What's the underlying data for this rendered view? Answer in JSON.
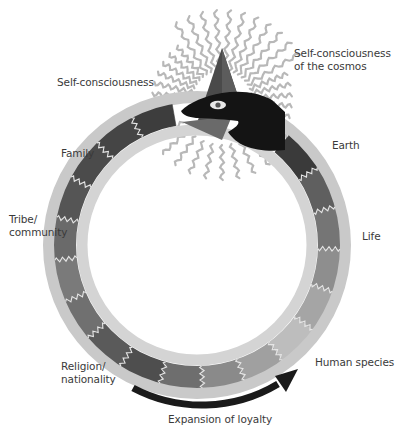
{
  "diagram": {
    "type": "ouroboros-cycle",
    "labels": {
      "self_consciousness": "Self-consciousness",
      "cosmos": "Self-consciousness\nof the cosmos",
      "family": "Family",
      "tribe": "Tribe/\ncommunity",
      "religion": "Religion/\nnationality",
      "human_species": "Human species",
      "life": "Life",
      "earth": "Earth",
      "expansion": "Expansion of loyalty"
    },
    "stages_in_order": [
      "Self-consciousness",
      "Family",
      "Tribe/community",
      "Religion/nationality",
      "Human species",
      "Life",
      "Earth",
      "Self-consciousness of the cosmos"
    ],
    "arrow_direction": "clockwise-left-to-right along bottom",
    "colors": {
      "outer_ring": "#c9c9c9",
      "inner_ring": "#d4d4d4",
      "snake_head": "#141414",
      "pyramid": "#4a4a4a",
      "rays": "#b8b8b8",
      "arrow": "#1a1a1a",
      "wave_lines": "#e6e6e6",
      "segments": [
        "#3d3d3d",
        "#454545",
        "#4b4b4b",
        "#555555",
        "#6a6a6a",
        "#7a7a7a",
        "#707070",
        "#5a5a5a",
        "#4e4e4e",
        "#6e6e6e",
        "#8a8a8a",
        "#a0a0a0",
        "#bdbdbd",
        "#a5a5a5",
        "#8e8e8e",
        "#757575",
        "#5f5f5f",
        "#3a3a3a"
      ]
    }
  }
}
